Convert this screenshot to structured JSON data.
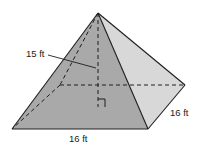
{
  "figure": {
    "type": "square-pyramid",
    "labels": {
      "height": "15 ft",
      "base_front": "16 ft",
      "base_side": "16 ft"
    },
    "colors": {
      "front_face": "#a9a9a9",
      "right_face": "#d8d8d8",
      "edge": "#1e1e1e",
      "background": "#ffffff"
    },
    "right_angle_marker": true
  }
}
